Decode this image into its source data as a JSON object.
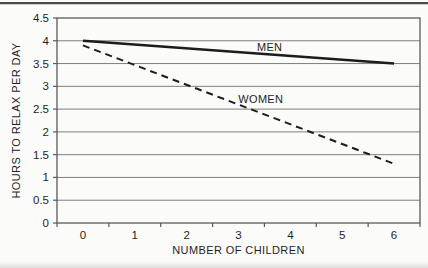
{
  "page": {
    "background": "#fbfbf9",
    "top_rule_color": "#4d4d4d"
  },
  "chart_data": {
    "type": "line",
    "title": "",
    "xlabel": "NUMBER OF CHILDREN",
    "ylabel": "HOURS TO RELAX PER DAY",
    "x_tick_labels": [
      "0",
      "1",
      "2",
      "3",
      "4",
      "5",
      "6"
    ],
    "y_ticks": [
      0,
      0.5,
      1,
      1.5,
      2,
      2.5,
      3,
      3.5,
      4,
      4.5
    ],
    "y_tick_labels": [
      "0",
      "0.5",
      "1",
      "1.5",
      "2",
      "2.5",
      "3",
      "3.5",
      "4",
      "4.5"
    ],
    "xlim": [
      0,
      6
    ],
    "ylim": [
      0,
      4.5
    ],
    "grid": "horizontal-only",
    "frame": true,
    "legend_position": "inline-labels",
    "series": [
      {
        "name": "MEN",
        "line_style": "solid",
        "x": [
          0,
          6
        ],
        "values": [
          4.0,
          3.5
        ],
        "label": {
          "text": "MEN",
          "x": 3.6,
          "y": 3.87
        }
      },
      {
        "name": "WOMEN",
        "line_style": "dashed",
        "x": [
          0,
          6
        ],
        "values": [
          3.9,
          1.3
        ],
        "label": {
          "text": "WOMEN",
          "x": 3.43,
          "y": 2.72
        }
      }
    ],
    "colors": {
      "line": "#1c1c1c",
      "grid": "#7f7f7f",
      "frame": "#5a5a5a",
      "text": "#1f1f1f"
    }
  }
}
